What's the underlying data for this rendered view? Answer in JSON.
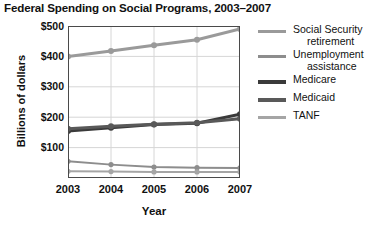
{
  "chart_data": {
    "type": "line",
    "title": "Federal Spending on Social Programs, 2003–2007",
    "xlabel": "Year",
    "ylabel": "Billions of dollars",
    "categories": [
      "2003",
      "2004",
      "2005",
      "2006",
      "2007"
    ],
    "x": [
      2003,
      2004,
      2005,
      2006,
      2007
    ],
    "ylim": [
      0,
      500
    ],
    "yticks": [
      "$100",
      "$200",
      "$300",
      "$400",
      "$500"
    ],
    "ytick_values": [
      100,
      200,
      300,
      400,
      500
    ],
    "grid": true,
    "legend_position": "right",
    "series": [
      {
        "name": "Social Security retirement",
        "label_line1": "Social Security",
        "label_line2": "retirement",
        "color": "#9a9a9a",
        "width": 3,
        "values": [
          400,
          418,
          437,
          455,
          490
        ]
      },
      {
        "name": "Unemployment assistance",
        "label_line1": "Unemployment",
        "label_line2": "assistance",
        "color": "#8d8d8d",
        "width": 2,
        "values": [
          55,
          44,
          36,
          34,
          33
        ]
      },
      {
        "name": "Medicare",
        "label_line1": "Medicare",
        "label_line2": "",
        "color": "#3a3a3a",
        "width": 3,
        "values": [
          155,
          165,
          176,
          180,
          210
        ]
      },
      {
        "name": "Medicaid",
        "label_line1": "Medicaid",
        "label_line2": "",
        "color": "#595959",
        "width": 3,
        "values": [
          162,
          170,
          177,
          182,
          195
        ]
      },
      {
        "name": "TANF",
        "label_line1": "TANF",
        "label_line2": "",
        "color": "#a5a5a5",
        "width": 2,
        "values": [
          22,
          21,
          20,
          20,
          20
        ]
      }
    ]
  },
  "colors": {
    "axis": "#4a4a4a",
    "grid": "#d6d6d6",
    "text": "#111111",
    "background": "#ffffff"
  }
}
